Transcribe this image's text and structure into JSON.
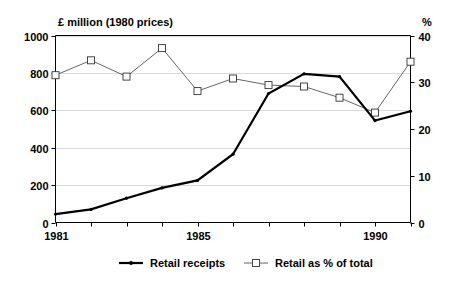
{
  "chart_data": {
    "type": "line",
    "title": "",
    "xlabel": "",
    "ylabel": "£ million (1980 prices)",
    "y2label": "%",
    "x": [
      1981,
      1982,
      1983,
      1984,
      1985,
      1986,
      1987,
      1988,
      1989,
      1990,
      1991
    ],
    "xtick_labels": [
      "1981",
      "",
      "",
      "",
      "1985",
      "",
      "",
      "",
      "",
      "1990",
      ""
    ],
    "xlim": [
      1981,
      1991
    ],
    "ylim": [
      0,
      1000
    ],
    "yticks": [
      0,
      200,
      400,
      600,
      800,
      1000
    ],
    "ytick_labels": [
      "0",
      "200",
      "400",
      "600",
      "800",
      "1000"
    ],
    "y2lim": [
      0,
      40
    ],
    "y2ticks": [
      0,
      10,
      20,
      30,
      40
    ],
    "y2tick_labels": [
      "0",
      "10",
      "20",
      "30",
      "40"
    ],
    "grid": true,
    "legend_position": "bottom",
    "series": [
      {
        "name": "Retail receipts",
        "axis": "left",
        "units": "£ million (1980 prices)",
        "marker": "dot",
        "color": "#000000",
        "values": [
          45,
          70,
          130,
          185,
          225,
          365,
          690,
          795,
          780,
          545,
          595
        ]
      },
      {
        "name": "Retail as % of total",
        "axis": "right",
        "units": "%",
        "marker": "square",
        "color": "#555555",
        "values": [
          31.5,
          34.7,
          31.2,
          37.3,
          28.1,
          30.8,
          29.4,
          29.1,
          26.7,
          23.5,
          34.4
        ]
      }
    ]
  },
  "axes": {
    "left_axis_title": "£ million (1980 prices)",
    "right_axis_title": "%"
  },
  "legend": {
    "items": [
      {
        "label": "Retail receipts",
        "marker": "line-dot"
      },
      {
        "label": "Retail as % of total",
        "marker": "line-square"
      }
    ]
  }
}
